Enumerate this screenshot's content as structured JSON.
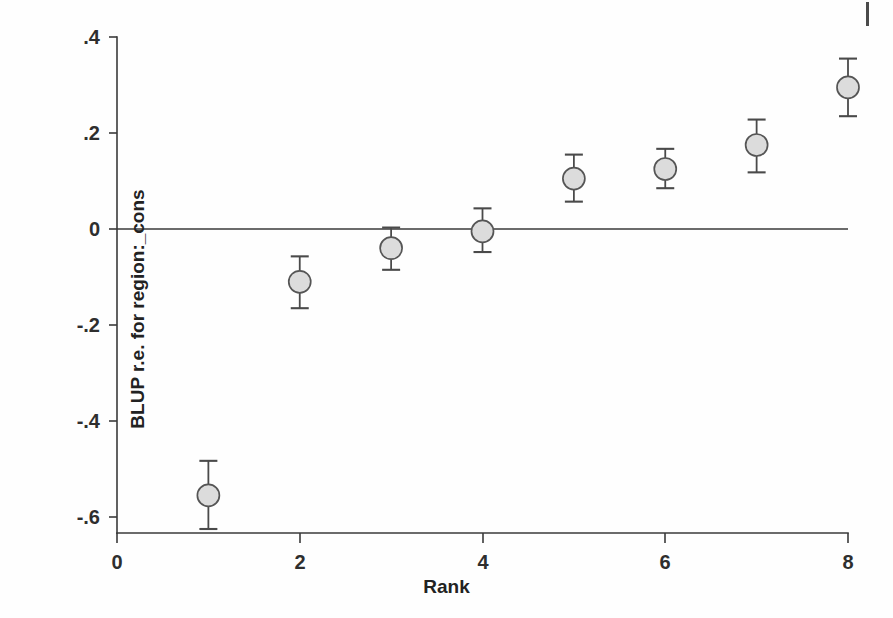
{
  "chart_data": {
    "type": "scatter",
    "title": "",
    "subtitle": "",
    "xlabel": "Rank",
    "ylabel": "BLUP r.e. for region:_cons",
    "xlim": [
      0,
      8
    ],
    "ylim": [
      -0.68,
      0.4
    ],
    "xticks": [
      "0",
      "2",
      "4",
      "6",
      "8"
    ],
    "xtick_values": [
      0,
      2,
      4,
      6,
      8
    ],
    "yticks": [
      "-.6",
      "-.4",
      "-.2",
      "0",
      ".2",
      ".4"
    ],
    "ytick_values": [
      -0.6,
      -0.4,
      -0.2,
      0,
      0.2,
      0.4
    ],
    "grid": false,
    "legend": "none",
    "reference_line_y": 0,
    "x": [
      1,
      2,
      3,
      4,
      5,
      6,
      7,
      8
    ],
    "values": [
      -0.555,
      -0.11,
      -0.04,
      -0.005,
      0.105,
      0.125,
      0.175,
      0.295
    ],
    "ci_low": [
      -0.625,
      -0.165,
      -0.085,
      -0.048,
      0.057,
      0.085,
      0.118,
      0.235
    ],
    "ci_high": [
      -0.483,
      -0.057,
      0.003,
      0.043,
      0.155,
      0.167,
      0.228,
      0.355
    ],
    "marker": {
      "shape": "circle",
      "fill_color": "#dcdcdc",
      "edge_color": "#555555",
      "radius_px": 11
    },
    "series_name": "BLUP random effect"
  },
  "axes": {
    "x_axis_name": "rank-axis",
    "y_axis_name": "blup-axis"
  },
  "colors": {
    "background": "#fefefe",
    "axis": "#3a3a3a",
    "text": "#222222",
    "error_bar": "#4a4a4a"
  }
}
